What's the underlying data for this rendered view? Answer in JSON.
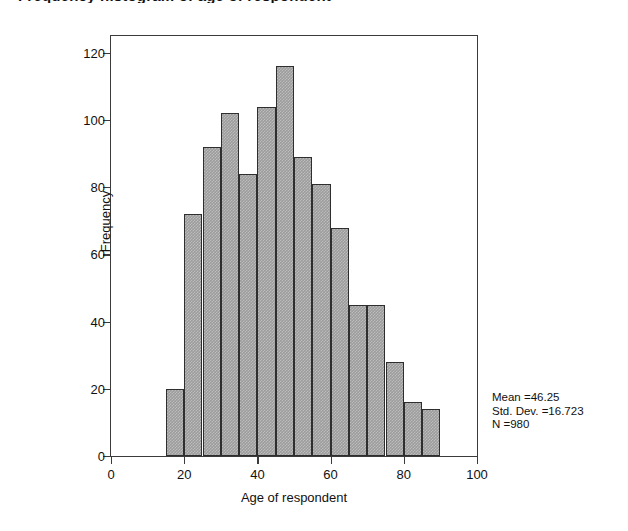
{
  "chart_title": "Frequency histogram of age of respondent",
  "colors": {
    "bar_fill": "#9c9c9c",
    "bar_border": "#2e2e2e",
    "axis": "#3b3b3b",
    "background": "#ffffff",
    "text": "#111111"
  },
  "stats": {
    "mean": "Mean =46.25",
    "std_dev": "Std. Dev. =16.723",
    "n": "N =980"
  },
  "chart_data": {
    "type": "bar",
    "title": "Frequency histogram of age of respondent",
    "xlabel": "Age of respondent",
    "ylabel": "Frequency",
    "xlim": [
      0,
      100
    ],
    "ylim": [
      0,
      125
    ],
    "xticks": [
      0,
      20,
      40,
      60,
      80,
      100
    ],
    "xtick_labels": [
      "0",
      "20",
      "40",
      "60",
      "80",
      "100"
    ],
    "yticks": [
      0,
      20,
      40,
      60,
      80,
      100,
      120
    ],
    "ytick_labels": [
      "0",
      "20",
      "40",
      "60",
      "80",
      "100",
      "120"
    ],
    "grid": false,
    "legend": false,
    "bin_width": 5,
    "bin_starts": [
      15,
      20,
      25,
      30,
      35,
      40,
      45,
      50,
      55,
      60,
      65,
      70,
      75,
      80,
      85
    ],
    "categories": [
      "15-20",
      "20-25",
      "25-30",
      "30-35",
      "35-40",
      "40-45",
      "45-50",
      "50-55",
      "55-60",
      "60-65",
      "65-70",
      "70-75",
      "75-80",
      "80-85",
      "85-90"
    ],
    "values": [
      20,
      72,
      92,
      102,
      84,
      104,
      116,
      89,
      81,
      68,
      45,
      45,
      28,
      16,
      14
    ],
    "annotations": [
      "Mean =46.25",
      "Std. Dev. =16.723",
      "N =980"
    ]
  }
}
